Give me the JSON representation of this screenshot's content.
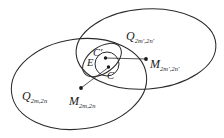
{
  "figure": {
    "caption": "",
    "background_color": "#ffffff",
    "stroke_color": "#262626",
    "text_color": "#1a1a1a",
    "width": 224,
    "height": 138
  },
  "labels": {
    "q_right": {
      "base": "Q",
      "subscript": "2m′,2n′"
    },
    "q_left": {
      "base": "Q",
      "subscript": "2m,2n"
    },
    "m_right": {
      "base": "M",
      "subscript": "2m′,2n′"
    },
    "m_left": {
      "base": "M",
      "subscript": "2m,2n"
    },
    "c_prime": {
      "base": "C′",
      "subscript": ""
    },
    "e_region": {
      "base": "E",
      "subscript": ""
    },
    "c_region": {
      "base": "C",
      "subscript": ""
    }
  },
  "shapes": {
    "ellipse_left": {
      "name": "Q_{2m,2n}",
      "cx": 79,
      "cy": 84,
      "rx": 68,
      "ry": 45,
      "rotation": -8
    },
    "ellipse_right": {
      "name": "Q_{2m',2n'}",
      "cx": 146,
      "cy": 49,
      "rx": 70,
      "ry": 40,
      "rotation": -4
    },
    "ellipse_e": {
      "name": "E",
      "cx": 102,
      "cy": 60,
      "rx": 22,
      "ry": 13,
      "rotation": -36
    },
    "circle_c": {
      "name": "C",
      "cx": 107,
      "cy": 64,
      "r": 12
    }
  },
  "points": {
    "m_left_point": {
      "x": 81,
      "y": 88
    },
    "m_right_point": {
      "x": 146,
      "y": 59
    },
    "center_dot_upper": {
      "x": 106,
      "y": 58
    },
    "center_dot_lower": {
      "x": 108,
      "y": 67
    }
  },
  "connectors": [
    {
      "name": "m-left-to-center",
      "x1": 81,
      "y1": 88,
      "x2": 108,
      "y2": 67
    },
    {
      "name": "center-to-m-right",
      "x1": 106,
      "y1": 58,
      "x2": 146,
      "y2": 59
    }
  ]
}
